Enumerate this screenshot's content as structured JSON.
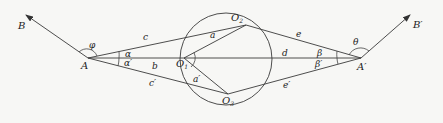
{
  "diagram": {
    "points": {
      "A": "A",
      "A_prime": "A′",
      "B": "B",
      "B_prime": "B′",
      "O1": "O",
      "O1_sub": "1",
      "O2": "O",
      "O2_sub": "2",
      "O3": "O",
      "O3_sub": "3"
    },
    "segments": {
      "c": "c",
      "b": "b",
      "c_prime": "c′",
      "a": "a",
      "a_prime": "a′",
      "d": "d",
      "e": "e",
      "e_prime": "e′"
    },
    "angles": {
      "phi": "φ",
      "alpha": "α",
      "alpha_prime": "α′",
      "beta": "β",
      "beta_prime": "β′",
      "theta": "θ"
    }
  }
}
